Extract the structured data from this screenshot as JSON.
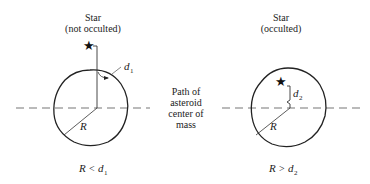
{
  "left_panel": {
    "title_line1": "Star",
    "title_line2": "(not occulted)",
    "distance_label": "d",
    "distance_sub": "1",
    "radius_label": "R",
    "condition_left": "R",
    "condition_op": "<",
    "condition_var": "d",
    "condition_sub": "1"
  },
  "right_panel": {
    "title_line1": "Star",
    "title_line2": "(occulted)",
    "distance_label": "d",
    "distance_sub": "2",
    "radius_label": "R",
    "condition_left": "R",
    "condition_op": ">",
    "condition_var": "d",
    "condition_sub": "2"
  },
  "path_label": {
    "line1": "Path of",
    "line2": "asteroid",
    "line3": "center of",
    "line4": "mass"
  }
}
